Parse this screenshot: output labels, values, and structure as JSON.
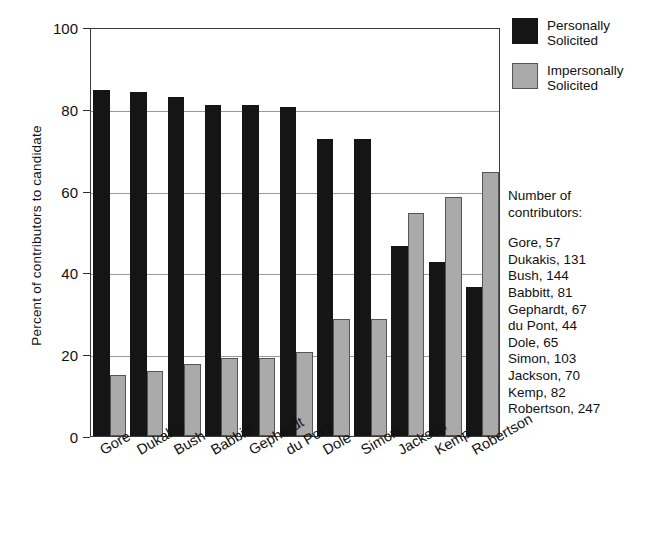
{
  "chart_data": {
    "type": "bar",
    "title": "",
    "xlabel": "",
    "ylabel": "Percent of contributors to candidate",
    "ylim": [
      0,
      100
    ],
    "yticks": [
      0,
      20,
      40,
      60,
      80,
      100
    ],
    "grid": true,
    "legend_position": "top-right",
    "categories": [
      "Gore",
      "Dukakis",
      "Bush",
      "Babbitt",
      "Gephardt",
      "du Pont",
      "Dole",
      "Simon",
      "Jackson",
      "Kemp",
      "Robertson"
    ],
    "series": [
      {
        "name": "Personally Solicited",
        "color": "#151515",
        "values": [
          84.5,
          84,
          83,
          81,
          81,
          80.5,
          72.5,
          72.5,
          46.5,
          42.5,
          36.5
        ]
      },
      {
        "name": "Impersonally Solicited",
        "color": "#aaaaaa",
        "values": [
          15,
          16,
          17.5,
          19,
          19,
          20.5,
          28.5,
          28.5,
          54.5,
          58.5,
          64.5
        ]
      }
    ],
    "annotations": {
      "contributors_heading_line1": "Number of",
      "contributors_heading_line2": "contributors:",
      "contributors": [
        "Gore, 57",
        "Dukakis, 131",
        "Bush, 144",
        "Babbitt, 81",
        "Gephardt, 67",
        "du Pont, 44",
        "Dole, 65",
        "Simon, 103",
        "Jackson, 70",
        "Kemp, 82",
        "Robertson, 247"
      ]
    }
  },
  "legend": {
    "items": [
      {
        "line1": "Personally",
        "line2": "Solicited"
      },
      {
        "line1": "Impersonally",
        "line2": "Solicited"
      }
    ]
  }
}
